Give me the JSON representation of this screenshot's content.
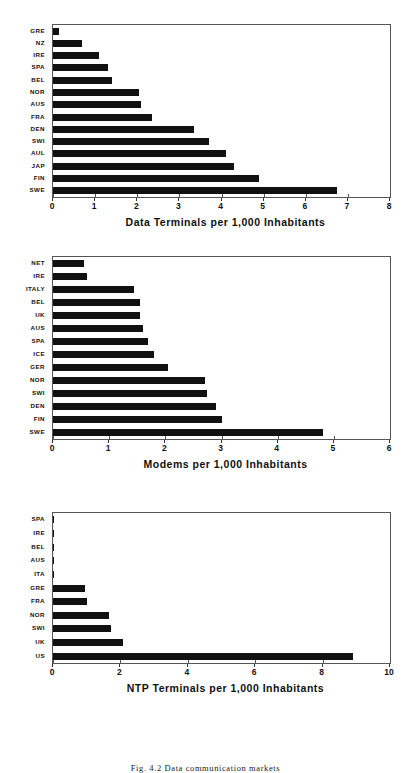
{
  "figure": {
    "caption": "Fig. 4.2   Data communication markets"
  },
  "chart_data": [
    {
      "type": "bar",
      "orientation": "horizontal",
      "title": "",
      "xlabel": "Data Terminals per 1,000 Inhabitants",
      "ylabel": "",
      "xlim": [
        0,
        8
      ],
      "xticks": [
        0,
        1,
        2,
        3,
        4,
        5,
        6,
        7,
        8
      ],
      "xticklabels": [
        "0",
        "1",
        "2",
        "3",
        "4",
        "5",
        "6",
        "7",
        "8"
      ],
      "grid": false,
      "legend": false,
      "bar_color": "#111111",
      "categories": [
        "GRE",
        "NZ",
        "IRE",
        "SPA",
        "BEL",
        "NOR",
        "AUS",
        "FRA",
        "DEN",
        "SWI",
        "AUL",
        "JAP",
        "FIN",
        "SWE"
      ],
      "values": [
        0.15,
        0.7,
        1.1,
        1.3,
        1.4,
        2.05,
        2.1,
        2.35,
        3.35,
        3.7,
        4.1,
        4.3,
        4.9,
        6.75
      ]
    },
    {
      "type": "bar",
      "orientation": "horizontal",
      "title": "",
      "xlabel": "Modems per 1,000 Inhabitants",
      "ylabel": "",
      "xlim": [
        0,
        6
      ],
      "xticks": [
        0,
        1,
        2,
        3,
        4,
        5,
        6
      ],
      "xticklabels": [
        "0",
        "1",
        "2",
        "3",
        "4",
        "5",
        "6"
      ],
      "grid": false,
      "legend": false,
      "bar_color": "#111111",
      "categories": [
        "NET",
        "IRE",
        "ITALY",
        "BEL",
        "UK",
        "AUS",
        "SPA",
        "ICE",
        "GER",
        "NOR",
        "SWI",
        "DEN",
        "FIN",
        "SWE"
      ],
      "values": [
        0.55,
        0.6,
        1.45,
        1.55,
        1.55,
        1.6,
        1.7,
        1.8,
        2.05,
        2.7,
        2.75,
        2.9,
        3.0,
        4.8
      ]
    },
    {
      "type": "bar",
      "orientation": "horizontal",
      "title": "",
      "xlabel": "NTP Terminals per 1,000 Inhabitants",
      "ylabel": "",
      "xlim": [
        0,
        10
      ],
      "xticks": [
        0,
        2,
        4,
        6,
        8,
        10
      ],
      "xticklabels": [
        "0",
        "2",
        "4",
        "6",
        "8",
        "10"
      ],
      "grid": false,
      "legend": false,
      "bar_color": "#111111",
      "categories": [
        "SPA",
        "IRE",
        "BEL",
        "AUS",
        "ITA",
        "GRE",
        "FRA",
        "NOR",
        "SWI",
        "UK",
        "US"
      ],
      "values": [
        0.01,
        0.02,
        0.03,
        0.03,
        0.04,
        0.95,
        1.0,
        1.65,
        1.72,
        2.08,
        8.9
      ]
    }
  ]
}
